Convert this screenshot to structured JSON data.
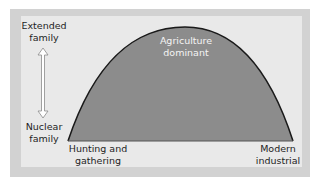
{
  "diagram": {
    "type": "curve-diagram",
    "y_axis": {
      "top_label": "Extended\nfamily",
      "bottom_label": "Nuclear\nfamily",
      "arrow": "double-headed-vertical-arrow"
    },
    "x_axis": {
      "left_label": "Hunting and\ngathering",
      "right_label": "Modern\nindustrial"
    },
    "curve": {
      "shape": "bell-arc",
      "peak_label": "Agriculture\ndominant",
      "fill_color": "#8c8c8c",
      "stroke_color": "#1a1a1a"
    },
    "colors": {
      "background": "#ffffff",
      "frame": "#d2d2d2",
      "panel": "#e9e9e9"
    }
  }
}
